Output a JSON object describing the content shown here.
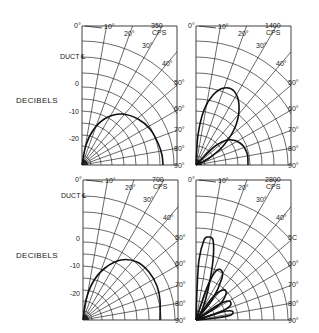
{
  "figure": {
    "y_axis_label": "DECIBELS",
    "duct_label": "DUCT ℄"
  },
  "chart_data": [
    {
      "type": "polar",
      "title": "350 CPS",
      "panel": "top-left",
      "ylabel": "DECIBELS",
      "db_ticks": [
        "0",
        "-10",
        "-20"
      ],
      "angle_ticks": [
        "0°",
        "10°",
        "20°",
        "30°",
        "40°",
        "50°",
        "60°",
        "70°",
        "80°",
        "90°"
      ],
      "reference_label": "DUCT ℄",
      "series": [
        {
          "name": "350 cps pattern",
          "points_xy": [
            [
              0,
              0
            ],
            [
              4,
              20
            ],
            [
              12,
              36
            ],
            [
              24,
              47
            ],
            [
              40,
              51
            ],
            [
              56,
              46
            ],
            [
              68,
              36
            ],
            [
              76,
              22
            ],
            [
              80,
              10
            ],
            [
              81,
              0
            ]
          ]
        }
      ]
    },
    {
      "type": "polar",
      "title": "1400 CPS",
      "panel": "top-right",
      "angle_ticks": [
        "0°",
        "10°",
        "20°",
        "30°",
        "40°",
        "50°",
        "60°",
        "70°",
        "80°",
        "90°"
      ],
      "series": [
        {
          "name": "main lobe",
          "points_xy": [
            [
              0,
              0
            ],
            [
              2,
              30
            ],
            [
              8,
              55
            ],
            [
              17,
              70
            ],
            [
              28,
              77
            ],
            [
              38,
              74
            ],
            [
              43,
              60
            ],
            [
              40,
              40
            ],
            [
              28,
              20
            ],
            [
              12,
              6
            ],
            [
              0,
              0
            ]
          ]
        },
        {
          "name": "side lobe",
          "points_xy": [
            [
              0,
              0
            ],
            [
              18,
              18
            ],
            [
              32,
              25
            ],
            [
              44,
              22
            ],
            [
              51,
              12
            ],
            [
              52,
              0
            ]
          ]
        }
      ]
    },
    {
      "type": "polar",
      "title": "700 CPS",
      "panel": "bottom-left",
      "ylabel": "DECIBELS",
      "db_ticks": [
        "0",
        "-10",
        "-20"
      ],
      "angle_ticks": [
        "0°",
        "10°",
        "20°",
        "30°",
        "40°",
        "50°",
        "60°",
        "70°",
        "80°",
        "90°"
      ],
      "reference_label": "DUCT ℄",
      "series": [
        {
          "name": "700 cps pattern",
          "points_xy": [
            [
              0,
              0
            ],
            [
              3,
              20
            ],
            [
              10,
              38
            ],
            [
              22,
              52
            ],
            [
              38,
              60
            ],
            [
              54,
              58
            ],
            [
              66,
              48
            ],
            [
              74,
              34
            ],
            [
              77,
              20
            ],
            [
              77,
              0
            ]
          ]
        }
      ]
    },
    {
      "type": "polar",
      "title": "2800 CPS",
      "panel": "bottom-right",
      "angle_ticks": [
        "0°",
        "10°",
        "20°",
        "30°",
        "40°",
        "5C",
        "60°",
        "70°",
        "80°",
        "90°"
      ],
      "series": [
        {
          "name": "main lobe",
          "points_xy": [
            [
              0,
              0
            ],
            [
              1,
              30
            ],
            [
              3,
              60
            ],
            [
              8,
              80
            ],
            [
              12,
              83
            ],
            [
              17,
              80
            ],
            [
              17,
              60
            ],
            [
              12,
              30
            ],
            [
              6,
              10
            ],
            [
              0,
              0
            ]
          ]
        },
        {
          "name": "lobe 2",
          "points_xy": [
            [
              0,
              0
            ],
            [
              10,
              30
            ],
            [
              19,
              48
            ],
            [
              25,
              50
            ],
            [
              26,
              42
            ],
            [
              16,
              20
            ],
            [
              0,
              0
            ]
          ]
        },
        {
          "name": "lobe 3",
          "points_xy": [
            [
              0,
              0
            ],
            [
              16,
              22
            ],
            [
              27,
              30
            ],
            [
              30,
              26
            ],
            [
              22,
              14
            ],
            [
              0,
              0
            ]
          ]
        },
        {
          "name": "lobe 4",
          "points_xy": [
            [
              0,
              0
            ],
            [
              22,
              15
            ],
            [
              33,
              19
            ],
            [
              34,
              14
            ],
            [
              22,
              7
            ],
            [
              0,
              0
            ]
          ]
        },
        {
          "name": "lobe 5",
          "points_xy": [
            [
              0,
              0
            ],
            [
              26,
              8
            ],
            [
              36,
              9
            ],
            [
              35,
              5
            ],
            [
              20,
              2
            ],
            [
              0,
              0
            ]
          ]
        }
      ]
    }
  ],
  "grid": {
    "ring_radii": [
      9,
      19,
      30,
      42,
      54,
      66,
      78,
      92,
      108,
      124
    ],
    "radial_angles": [
      10,
      20,
      30,
      40,
      50,
      60,
      70,
      80
    ]
  },
  "panels": [
    {
      "id": "top-left",
      "origin": [
        82,
        165
      ],
      "width": 95,
      "height": 139,
      "freq": "350",
      "unit": "CPS",
      "db_label_y": [
        83,
        111,
        138
      ],
      "duct_y": 56
    },
    {
      "id": "top-right",
      "origin": [
        196,
        165
      ],
      "width": 95,
      "height": 139,
      "freq": "1400",
      "unit": "CPS"
    },
    {
      "id": "bottom-left",
      "origin": [
        83,
        320
      ],
      "width": 95,
      "height": 140,
      "freq": "700",
      "unit": "CPS",
      "db_label_y": [
        238,
        265,
        293
      ],
      "duct_y": 195
    },
    {
      "id": "bottom-right",
      "origin": [
        196,
        320
      ],
      "width": 95,
      "height": 140,
      "freq": "2800",
      "unit": "CPS"
    }
  ],
  "decibels_label_positions": [
    [
      16,
      103
    ],
    [
      16,
      258
    ]
  ]
}
